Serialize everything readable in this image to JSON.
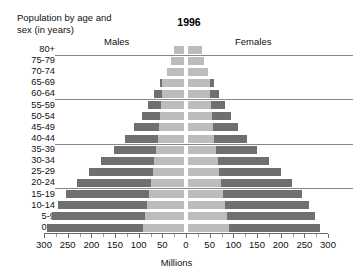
{
  "header": {
    "caption_line1": "Population by age and",
    "caption_line2": "sex (in years)",
    "year": "1996",
    "males_label": "Males",
    "females_label": "Females"
  },
  "axis": {
    "title": "Millions",
    "tick_labels": [
      "300",
      "250",
      "200",
      "150",
      "100",
      "50",
      "0",
      "50",
      "100",
      "150",
      "200",
      "250",
      "300"
    ]
  },
  "colors": {
    "bar_dark": "#6f6f6f",
    "bar_light": "#bcbcbc",
    "gridline": "#8a8a8a",
    "axis": "#6b6b6b",
    "text": "#111111"
  },
  "chart_data": {
    "type": "bar",
    "subtype": "population-pyramid",
    "title": "1996",
    "subtitle": "Population by age and sex (in years)",
    "xlabel": "Millions",
    "ylabel": "Population by age and sex (in years)",
    "xlim": [
      -300,
      300
    ],
    "xticks": [
      -300,
      -250,
      -200,
      -150,
      -100,
      -50,
      0,
      50,
      100,
      150,
      200,
      250,
      300
    ],
    "xtick_labels": [
      "300",
      "250",
      "200",
      "150",
      "100",
      "50",
      "0",
      "50",
      "100",
      "150",
      "200",
      "250",
      "300"
    ],
    "minor_tick_step": 25,
    "grid": "horizontal rules after 80+, 60-64, 40-44, 20-24",
    "gridline_after_categories": [
      "80+",
      "60-64",
      "40-44",
      "20-24"
    ],
    "legend": [
      "Males",
      "Females"
    ],
    "legend_position": "top, left of centre (Males) and right of centre (Females)",
    "categories": [
      "80+",
      "75-79",
      "70-74",
      "65-69",
      "60-64",
      "55-59",
      "50-54",
      "45-49",
      "40-44",
      "35-39",
      "30-34",
      "25-29",
      "20-24",
      "15-19",
      "10-14",
      "5-9",
      "0-4"
    ],
    "series": [
      {
        "name": "Males",
        "side": "left",
        "values": [
          20,
          26,
          36,
          50,
          63,
          76,
          89,
          105,
          125,
          148,
          175,
          200,
          225,
          248,
          265,
          279,
          290
        ]
      },
      {
        "name": "Females",
        "side": "right",
        "values": [
          30,
          33,
          42,
          55,
          66,
          78,
          90,
          105,
          124,
          146,
          171,
          196,
          220,
          241,
          256,
          268,
          278
        ]
      }
    ],
    "inner_shading": {
      "description": "lighter grey inner region of each bar measured from the centre axis outward, widening toward younger ages",
      "color": "#bcbcbc",
      "left_values": [
        20,
        26,
        36,
        46,
        46,
        48,
        50,
        52,
        55,
        58,
        62,
        66,
        70,
        74,
        78,
        82,
        86
      ],
      "right_values": [
        30,
        33,
        42,
        46,
        46,
        48,
        50,
        52,
        55,
        58,
        62,
        66,
        70,
        74,
        78,
        82,
        86
      ]
    },
    "rows": [
      {
        "age": "80+",
        "males": 20,
        "females": 30,
        "males_inner": 20,
        "females_inner": 30
      },
      {
        "age": "75-79",
        "males": 26,
        "females": 33,
        "males_inner": 26,
        "females_inner": 33
      },
      {
        "age": "70-74",
        "males": 36,
        "females": 42,
        "males_inner": 36,
        "females_inner": 42
      },
      {
        "age": "65-69",
        "males": 50,
        "females": 55,
        "males_inner": 46,
        "females_inner": 46
      },
      {
        "age": "60-64",
        "males": 63,
        "females": 66,
        "males_inner": 46,
        "females_inner": 46
      },
      {
        "age": "55-59",
        "males": 76,
        "females": 78,
        "males_inner": 48,
        "females_inner": 48
      },
      {
        "age": "50-54",
        "males": 89,
        "females": 90,
        "males_inner": 50,
        "females_inner": 50
      },
      {
        "age": "45-49",
        "males": 105,
        "females": 105,
        "males_inner": 52,
        "females_inner": 52
      },
      {
        "age": "40-44",
        "males": 125,
        "females": 124,
        "males_inner": 55,
        "females_inner": 55
      },
      {
        "age": "35-39",
        "males": 148,
        "females": 146,
        "males_inner": 58,
        "females_inner": 58
      },
      {
        "age": "30-34",
        "males": 175,
        "females": 171,
        "males_inner": 62,
        "females_inner": 62
      },
      {
        "age": "25-29",
        "males": 200,
        "females": 196,
        "males_inner": 66,
        "females_inner": 66
      },
      {
        "age": "20-24",
        "males": 225,
        "females": 220,
        "males_inner": 70,
        "females_inner": 70
      },
      {
        "age": "15-19",
        "males": 248,
        "females": 241,
        "males_inner": 74,
        "females_inner": 74
      },
      {
        "age": "10-14",
        "males": 265,
        "females": 256,
        "males_inner": 78,
        "females_inner": 78
      },
      {
        "age": "5-9",
        "males": 279,
        "females": 268,
        "males_inner": 82,
        "females_inner": 82
      },
      {
        "age": "0-4",
        "males": 290,
        "females": 278,
        "males_inner": 86,
        "females_inner": 86
      }
    ]
  }
}
